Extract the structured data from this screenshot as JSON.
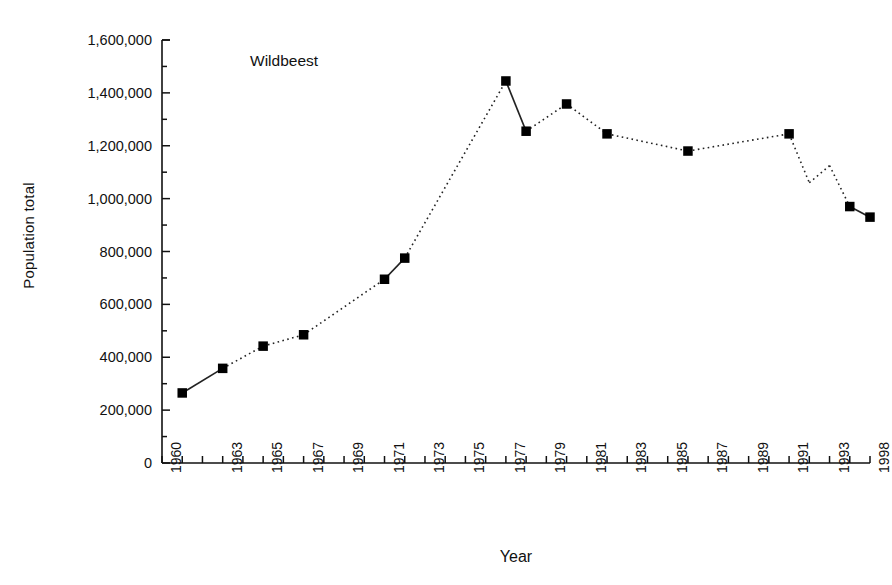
{
  "chart_data": {
    "type": "line",
    "title": "Wildbeest",
    "xlabel": "Year",
    "ylabel": "Population total",
    "grid": false,
    "legend": "none",
    "xlim": [
      1960,
      1998
    ],
    "ylim": [
      0,
      1600000
    ],
    "y_major_step": 200000,
    "y_minor_step": 100000,
    "y_tick_labels": [
      "0",
      "200,000",
      "400,000",
      "600,000",
      "800,000",
      "1,000,000",
      "1,200,000",
      "1,400,000",
      "1,600,000"
    ],
    "y_tick_values": [
      0,
      200000,
      400000,
      600000,
      800000,
      1000000,
      1200000,
      1400000,
      1600000
    ],
    "x_tick_labels": [
      "1960",
      "1963",
      "1965",
      "1967",
      "1969",
      "1971",
      "1973",
      "1975",
      "1977",
      "1979",
      "1981",
      "1983",
      "1985",
      "1987",
      "1989",
      "1991",
      "1993",
      "1998"
    ],
    "x_tick_positions": [
      1960,
      1963,
      1965,
      1967,
      1969,
      1971,
      1973,
      1975,
      1977,
      1979,
      1981,
      1983,
      1985,
      1987,
      1989,
      1991,
      1993,
      1998
    ],
    "series": [
      {
        "name": "Wildbeest",
        "marker": "filled-square",
        "line_style": "dotted-with-solid-segments",
        "x": [
          1961,
          1963,
          1965,
          1967,
          1971,
          1972,
          1977,
          1978,
          1980,
          1982,
          1986,
          1991,
          1994,
          1998
        ],
        "values": [
          265000,
          358000,
          442000,
          485000,
          695000,
          775000,
          1445000,
          1255000,
          1358000,
          1245000,
          1180000,
          1245000,
          970000,
          930000
        ]
      }
    ],
    "unmarked_vertices": {
      "x": [
        1992,
        1993
      ],
      "values": [
        1060000,
        1125000
      ]
    },
    "solid_segments": [
      [
        1961,
        1963
      ],
      [
        1971,
        1972
      ],
      [
        1977,
        1978
      ],
      [
        1994,
        1998
      ]
    ]
  },
  "colors": {
    "axis": "#111111",
    "marker": "#000000",
    "line": "#222222",
    "background": "#ffffff"
  }
}
